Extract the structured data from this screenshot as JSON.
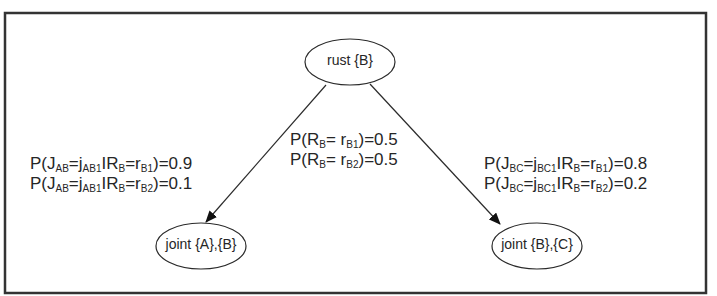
{
  "diagram": {
    "nodes": [
      {
        "id": "rust",
        "label": "rust {B}",
        "cx": 350,
        "cy": 62,
        "rx": 45,
        "ry": 23
      },
      {
        "id": "jointAB",
        "label": "joint {A},{B}",
        "cx": 201,
        "cy": 246,
        "rx": 45,
        "ry": 23
      },
      {
        "id": "jointBC",
        "label": "joint {B},{C}",
        "cx": 537,
        "cy": 246,
        "rx": 45,
        "ry": 23
      }
    ],
    "edges": [
      {
        "from": "rust",
        "to": "jointAB"
      },
      {
        "from": "rust",
        "to": "jointBC"
      }
    ],
    "labels": {
      "prior": {
        "line1": {
          "pre": "P(R",
          "s1": "B",
          "mid": "= r",
          "s2": "B1",
          "post": ")=0.5"
        },
        "line2": {
          "pre": "P(R",
          "s1": "B",
          "mid": "= r",
          "s2": "B2",
          "post": ")=0.5"
        }
      },
      "left": {
        "line1": {
          "a": "P(J",
          "s1": "AB",
          "b": "=j",
          "s2": "AB1",
          "c": "IR",
          "s3": "B",
          "d": "=r",
          "s4": "B1",
          "e": ")=0.9"
        },
        "line2": {
          "a": "P(J",
          "s1": "AB",
          "b": "=j",
          "s2": "AB1",
          "c": "IR",
          "s3": "B",
          "d": "=r",
          "s4": "B2",
          "e": ")=0.1"
        }
      },
      "right": {
        "line1": {
          "a": "P(J",
          "s1": "BC",
          "b": "=j",
          "s2": "BC1",
          "c": "IR",
          "s3": "B",
          "d": "=r",
          "s4": "B1",
          "e": ")=0.8"
        },
        "line2": {
          "a": "P(J",
          "s1": "BC",
          "b": "=j",
          "s2": "BC1",
          "c": "IR",
          "s3": "B",
          "d": "=r",
          "s4": "B2",
          "e": ")=0.2"
        }
      }
    },
    "colors": {
      "stroke": "#2a2a2a",
      "frame": "#333333"
    }
  }
}
